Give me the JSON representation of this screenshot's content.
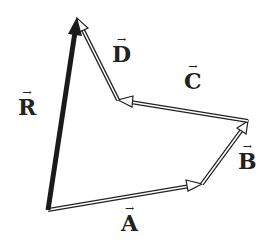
{
  "diagram": {
    "type": "vector-addition",
    "vectors": [
      {
        "name": "A",
        "label": "A",
        "from": [
          48,
          210
        ],
        "to": [
          202,
          184
        ],
        "style": "hollow"
      },
      {
        "name": "B",
        "label": "B",
        "from": [
          202,
          184
        ],
        "to": [
          248,
          121
        ],
        "style": "hollow"
      },
      {
        "name": "C",
        "label": "C",
        "from": [
          248,
          121
        ],
        "to": [
          118,
          100
        ],
        "style": "hollow"
      },
      {
        "name": "D",
        "label": "D",
        "from": [
          118,
          100
        ],
        "to": [
          77,
          18
        ],
        "style": "hollow"
      },
      {
        "name": "R",
        "label": "R",
        "from": [
          48,
          210
        ],
        "to": [
          77,
          18
        ],
        "style": "solid"
      }
    ],
    "arrow_symbol": "→",
    "colors": {
      "stroke": "#222222",
      "fill": "#ffffff"
    }
  }
}
